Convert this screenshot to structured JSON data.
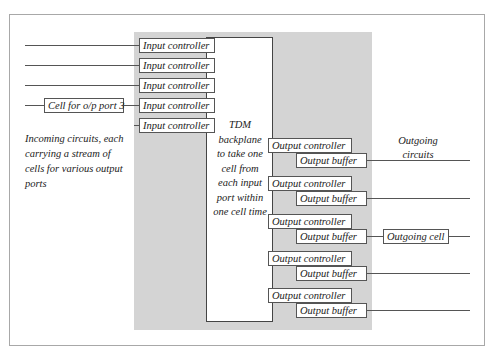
{
  "diagram": {
    "type": "block-diagram",
    "title": "",
    "input_controllers": [
      {
        "label": "Input controller"
      },
      {
        "label": "Input controller"
      },
      {
        "label": "Input controller"
      },
      {
        "label": "Input controller"
      },
      {
        "label": "Input controller"
      }
    ],
    "incoming_cell": {
      "label": "Cell for o/p port 3"
    },
    "incoming_caption": "Incoming circuits, each carrying a stream of cells for various output ports",
    "incoming_caption_lines": [
      "Incoming circuits, each",
      "carrying a stream of",
      "cells for various output",
      "ports"
    ],
    "backplane": {
      "lines": [
        "TDM",
        "backplane",
        "to take one",
        "cell from",
        "each input",
        "port within",
        "one cell time"
      ]
    },
    "output_ports": [
      {
        "controller": "Output controller",
        "buffer": "Output buffer"
      },
      {
        "controller": "Output controller",
        "buffer": "Output buffer"
      },
      {
        "controller": "Output controller",
        "buffer": "Output buffer"
      },
      {
        "controller": "Output controller",
        "buffer": "Output buffer"
      },
      {
        "controller": "Output controller",
        "buffer": "Output buffer"
      }
    ],
    "outgoing_cell": {
      "label": "Outgoing cell"
    },
    "outgoing_caption_lines": [
      "Outgoing",
      "circuits"
    ],
    "colors": {
      "shade": "#d4d4d4",
      "frame": "#a8a8a8",
      "line": "#555555"
    }
  }
}
